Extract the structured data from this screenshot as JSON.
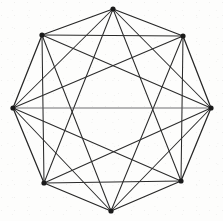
{
  "figure": {
    "background_color": "#fdfdfc",
    "stroke_color": "#2b2b2b",
    "vertex_color": "#1a1a1a",
    "vertex_count": 8,
    "edge_count": 24,
    "canvas": {
      "width": 223,
      "height": 221
    }
  },
  "chart_data": {
    "type": "scatter",
    "xlabel": "",
    "ylabel": "",
    "xlim": [
      0,
      223
    ],
    "ylim": [
      0,
      221
    ],
    "grid": false,
    "legend": "none",
    "nodes": [
      {
        "id": "v0",
        "label": "top",
        "x": 113,
        "y": 9
      },
      {
        "id": "v1",
        "label": "upper-right",
        "x": 183,
        "y": 36
      },
      {
        "id": "v2",
        "label": "right",
        "x": 211,
        "y": 108
      },
      {
        "id": "v3",
        "label": "lower-right",
        "x": 181,
        "y": 181
      },
      {
        "id": "v4",
        "label": "bottom",
        "x": 111,
        "y": 211
      },
      {
        "id": "v5",
        "label": "lower-left",
        "x": 44,
        "y": 183
      },
      {
        "id": "v6",
        "label": "left",
        "x": 13,
        "y": 108
      },
      {
        "id": "v7",
        "label": "upper-left",
        "x": 42,
        "y": 35
      }
    ],
    "edges": [
      {
        "from": "v0",
        "to": "v1",
        "kind": "perimeter"
      },
      {
        "from": "v1",
        "to": "v2",
        "kind": "perimeter"
      },
      {
        "from": "v2",
        "to": "v3",
        "kind": "perimeter"
      },
      {
        "from": "v3",
        "to": "v4",
        "kind": "perimeter"
      },
      {
        "from": "v4",
        "to": "v5",
        "kind": "perimeter"
      },
      {
        "from": "v5",
        "to": "v6",
        "kind": "perimeter"
      },
      {
        "from": "v6",
        "to": "v7",
        "kind": "perimeter"
      },
      {
        "from": "v7",
        "to": "v0",
        "kind": "perimeter"
      },
      {
        "from": "v0",
        "to": "v2",
        "kind": "chord"
      },
      {
        "from": "v1",
        "to": "v3",
        "kind": "chord"
      },
      {
        "from": "v2",
        "to": "v4",
        "kind": "chord"
      },
      {
        "from": "v3",
        "to": "v5",
        "kind": "chord"
      },
      {
        "from": "v4",
        "to": "v6",
        "kind": "chord"
      },
      {
        "from": "v5",
        "to": "v7",
        "kind": "chord"
      },
      {
        "from": "v6",
        "to": "v0",
        "kind": "chord"
      },
      {
        "from": "v7",
        "to": "v1",
        "kind": "chord"
      },
      {
        "from": "v0",
        "to": "v3",
        "kind": "chord"
      },
      {
        "from": "v1",
        "to": "v4",
        "kind": "chord"
      },
      {
        "from": "v2",
        "to": "v5",
        "kind": "chord"
      },
      {
        "from": "v3",
        "to": "v6",
        "kind": "chord"
      },
      {
        "from": "v4",
        "to": "v7",
        "kind": "chord"
      },
      {
        "from": "v5",
        "to": "v0",
        "kind": "chord"
      },
      {
        "from": "v6",
        "to": "v1",
        "kind": "chord"
      },
      {
        "from": "v7",
        "to": "v2",
        "kind": "chord"
      },
      {
        "from": "v6",
        "to": "v2",
        "kind": "diameter"
      }
    ]
  }
}
